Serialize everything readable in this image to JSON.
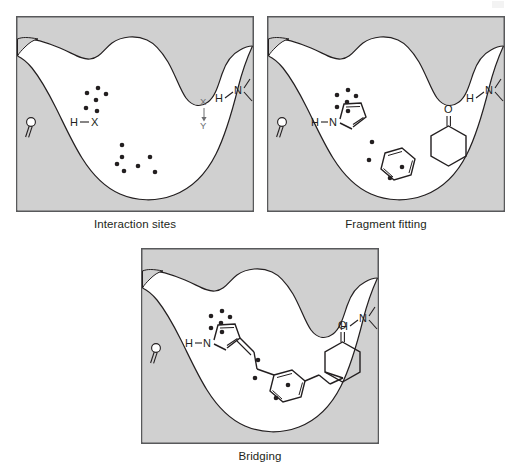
{
  "figure": {
    "background_color": "#ffffff",
    "panel_count": 3
  },
  "style": {
    "protein_fill": "#d0d0d0",
    "pocket_fill": "#ffffff",
    "outline_color": "#231f20",
    "frame_color": "#58595b",
    "dot_color": "#231f20",
    "bond_color": "#231f20",
    "dot_radius": 2.3,
    "caption_font_size": "11.5px"
  },
  "panels": [
    {
      "id": "interaction-sites",
      "caption": "Interaction sites",
      "x": 16,
      "y": 16,
      "width": 238,
      "height": 196,
      "labels": [
        {
          "name": "carbonyl-oxygen-label",
          "text": "O",
          "x": 27,
          "y": 122
        },
        {
          "name": "hydrogen-x-donor-label",
          "text": "H—X",
          "x": 70,
          "y": 120
        },
        {
          "name": "x-acceptor-label",
          "text": "X",
          "x": 203,
          "y": 104
        },
        {
          "name": "y-acceptor-label",
          "text": "Y",
          "x": 203,
          "y": 122
        },
        {
          "name": "amide-hydrogen-label",
          "text": "H",
          "x": 219,
          "y": 98
        },
        {
          "name": "amide-nitrogen-label",
          "text": "N",
          "x": 236,
          "y": 92
        }
      ],
      "hotspot_clusters": [
        {
          "name": "upper-hotspot-cluster",
          "count": 6,
          "dots": [
            [
              87,
              93
            ],
            [
              98,
              88
            ],
            [
              106,
              94
            ],
            [
              96,
              99
            ],
            [
              86,
              108
            ],
            [
              98,
              110
            ]
          ]
        },
        {
          "name": "lower-hotspot-cluster",
          "count": 7,
          "dots": [
            [
              122,
              145
            ],
            [
              122,
              157
            ],
            [
              117,
              164
            ],
            [
              124,
              171
            ],
            [
              150,
              157
            ],
            [
              155,
              172
            ],
            [
              138,
              166
            ]
          ]
        }
      ],
      "fragments": []
    },
    {
      "id": "fragment-fitting",
      "caption": "Fragment fitting",
      "x": 267,
      "y": 16,
      "width": 238,
      "height": 196,
      "labels": [
        {
          "name": "carbonyl-oxygen-label",
          "text": "O",
          "x": 278,
          "y": 122
        },
        {
          "name": "pyrrole-hydrogen-label",
          "text": "H",
          "x": 314,
          "y": 121
        },
        {
          "name": "pyrrole-nitrogen-label",
          "text": "N",
          "x": 330,
          "y": 121
        },
        {
          "name": "amide-hydrogen-label",
          "text": "H",
          "x": 468,
          "y": 98
        },
        {
          "name": "amide-nitrogen-label",
          "text": "N",
          "x": 485,
          "y": 92
        },
        {
          "name": "ketone-oxygen-label",
          "text": "O",
          "x": 449,
          "y": 109
        }
      ],
      "hotspot_clusters": [
        {
          "name": "pyrrole-hotspot-cluster",
          "count": 6,
          "dots": [
            [
              337,
              95
            ],
            [
              348,
              90
            ],
            [
              356,
              96
            ],
            [
              347,
              102
            ],
            [
              337,
              107
            ],
            [
              348,
              111
            ]
          ]
        },
        {
          "name": "benzene-hotspot-cluster",
          "count": 4,
          "dots": [
            [
              372,
              142
            ],
            [
              369,
              160
            ],
            [
              402,
              167
            ],
            [
              390,
              178
            ]
          ]
        }
      ],
      "fragments": [
        {
          "name": "pyrrole-fragment",
          "type": "pyrrole-ring"
        },
        {
          "name": "benzene-fragment",
          "type": "benzene-ring"
        },
        {
          "name": "cyclohexanone-fragment",
          "type": "cyclohexanone-ring"
        }
      ]
    },
    {
      "id": "bridging",
      "caption": "Bridging",
      "x": 141,
      "y": 248,
      "width": 238,
      "height": 196,
      "labels": [
        {
          "name": "carbonyl-oxygen-label",
          "text": "O",
          "x": 152,
          "y": 347
        },
        {
          "name": "pyrrole-hydrogen-label",
          "text": "H",
          "x": 190,
          "y": 343
        },
        {
          "name": "pyrrole-nitrogen-label",
          "text": "N",
          "x": 206,
          "y": 343
        },
        {
          "name": "amide-hydrogen-label",
          "text": "H",
          "x": 343,
          "y": 322
        },
        {
          "name": "amide-nitrogen-label",
          "text": "N",
          "x": 360,
          "y": 316
        },
        {
          "name": "ketone-oxygen-label",
          "text": "O",
          "x": 327,
          "y": 333
        }
      ],
      "hotspot_clusters": [
        {
          "name": "pyrrole-hotspot-cluster",
          "count": 6,
          "dots": [
            [
              213,
              318
            ],
            [
              224,
              313
            ],
            [
              232,
              319
            ],
            [
              223,
              325
            ],
            [
              213,
              330
            ],
            [
              224,
              334
            ]
          ]
        },
        {
          "name": "benzene-hotspot-cluster",
          "count": 4,
          "dots": [
            [
              250,
              363
            ],
            [
              248,
              381
            ],
            [
              280,
              388
            ],
            [
              268,
              400
            ]
          ]
        }
      ],
      "fragments": [
        {
          "name": "pyrrole-fragment",
          "type": "pyrrole-ring"
        },
        {
          "name": "vinyl-linker",
          "type": "vinyl-bridge"
        },
        {
          "name": "benzene-fragment",
          "type": "benzene-ring"
        },
        {
          "name": "ethylene-linker",
          "type": "ethylene-bridge"
        },
        {
          "name": "cyclohexanone-fragment",
          "type": "cyclohexanone-ring"
        }
      ]
    }
  ],
  "captions": {
    "panel1": "Interaction sites",
    "panel2": "Fragment fitting",
    "panel3": "Bridging"
  }
}
